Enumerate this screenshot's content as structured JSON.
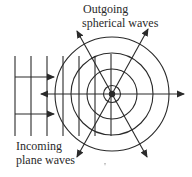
{
  "labels": {
    "outgoing_line1": "Outgoing",
    "outgoing_line2": "spherical waves",
    "incoming_line1": "Incoming",
    "incoming_line2": "plane waves"
  },
  "colors": {
    "stroke": "#2a2a2a",
    "background": "#ffffff"
  }
}
